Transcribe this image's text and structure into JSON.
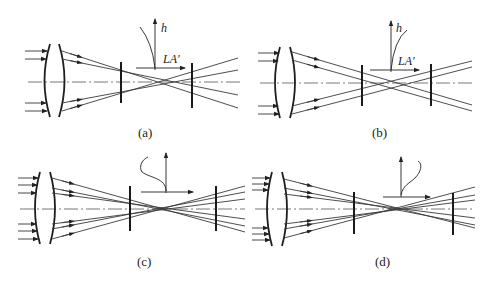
{
  "figure": {
    "panels": [
      {
        "id": "a",
        "caption": "(a)",
        "axis_labels": {
          "vertical": "h",
          "horizontal": "LA'"
        },
        "aberration_curve": "undercorrected"
      },
      {
        "id": "b",
        "caption": "(b)",
        "axis_labels": {
          "vertical": "h",
          "horizontal": "LA'"
        },
        "aberration_curve": "overcorrected"
      },
      {
        "id": "c",
        "caption": "(c)",
        "axis_labels": {
          "vertical": "",
          "horizontal": ""
        },
        "aberration_curve": "zonal-under"
      },
      {
        "id": "d",
        "caption": "(d)",
        "axis_labels": {
          "vertical": "",
          "horizontal": ""
        },
        "aberration_curve": "zonal-over"
      }
    ]
  },
  "colors": {
    "line": "#222222",
    "background": "#ffffff"
  }
}
